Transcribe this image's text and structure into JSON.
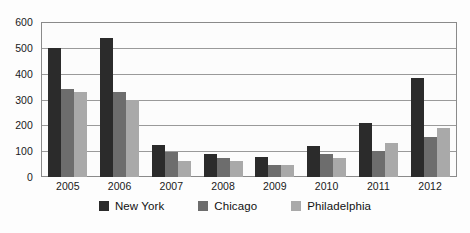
{
  "chart_data": {
    "type": "bar",
    "title": "",
    "subtitle": "",
    "xlabel": "",
    "ylabel": "",
    "categories": [
      "2005",
      "2006",
      "2007",
      "2008",
      "2009",
      "2010",
      "2011",
      "2012"
    ],
    "series": [
      {
        "name": "New York",
        "color": "#2b2b2b",
        "values": [
          500,
          540,
          125,
          90,
          78,
          120,
          208,
          385
        ]
      },
      {
        "name": "Chicago",
        "color": "#6d6d6d",
        "values": [
          340,
          330,
          95,
          75,
          48,
          90,
          102,
          155
        ]
      },
      {
        "name": "Philadelphia",
        "color": "#a9a9a9",
        "values": [
          330,
          300,
          62,
          63,
          48,
          75,
          130,
          190
        ]
      }
    ],
    "ylim": [
      0,
      600
    ],
    "yticks": [
      0,
      100,
      200,
      300,
      400,
      500,
      600
    ],
    "ytick_labels": [
      "0",
      "100",
      "200",
      "300",
      "400",
      "500",
      "600"
    ],
    "grid": true,
    "grid_axis": "y",
    "legend_position": "bottom",
    "legend_entries": [
      "New York",
      "Chicago",
      "Philadelphia"
    ]
  }
}
